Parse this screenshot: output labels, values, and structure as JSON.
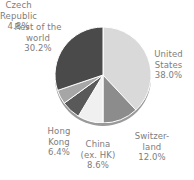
{
  "chart_data": {
    "type": "pie",
    "title": "",
    "subtitle": "",
    "xlabel": "",
    "ylabel": "",
    "legend_position": "none",
    "grid": false,
    "labels_outside": true,
    "start_angle_deg": 0,
    "direction": "clockwise",
    "categories": [
      "United States",
      "Switzerland",
      "China (ex. HK)",
      "Hong Kong",
      "Czech Republic",
      "Rest of the world"
    ],
    "values": [
      38.0,
      12.0,
      8.6,
      6.4,
      4.8,
      30.2
    ],
    "value_suffix": "%",
    "colors": [
      "#d9d9d9",
      "#8c8c8c",
      "#f0f0f0",
      "#595959",
      "#a6a6a6",
      "#4a4a4a"
    ],
    "slices": [
      {
        "name": "United States",
        "value": 38.0,
        "value_text": "38.0%",
        "color": "#d9d9d9"
      },
      {
        "name": "Switzerland",
        "value": 12.0,
        "value_text": "12.0%",
        "color": "#8c8c8c"
      },
      {
        "name": "China (ex. HK)",
        "value": 8.6,
        "value_text": "8.6%",
        "color": "#f0f0f0"
      },
      {
        "name": "Hong Kong",
        "value": 6.4,
        "value_text": "6.4%",
        "color": "#595959"
      },
      {
        "name": "Czech Republic",
        "value": 4.8,
        "value_text": "4.8%",
        "color": "#a6a6a6"
      },
      {
        "name": "Rest of the world",
        "value": 30.2,
        "value_text": "30.2%",
        "color": "#4a4a4a"
      }
    ]
  },
  "labels": {
    "rest_of_world": "Rest of the\nworld\n30.2%",
    "united_states": "United\nStates\n38.0%",
    "switzerland": "Switzer-\nland\n12.0%",
    "china": "China\n(ex. HK)\n8.6%",
    "hong_kong": "Hong\nKong\n6.4%",
    "czech_republic": "Czech\nRepublic\n4.8%"
  },
  "style": {
    "background": "#ffffff",
    "label_color": "#7d7d7d",
    "rim_color": "#9a9a9a",
    "separator_color": "#ffffff"
  }
}
